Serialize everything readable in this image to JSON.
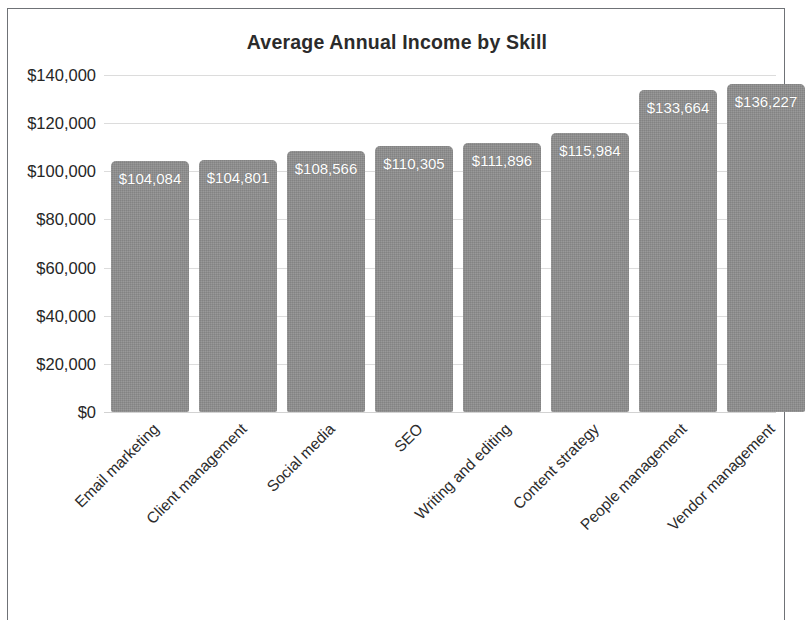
{
  "chart_data": {
    "type": "bar",
    "title": "Average Annual Income by Skill",
    "xlabel": "",
    "ylabel": "",
    "categories": [
      "Email marketing",
      "Client management",
      "Social media",
      "SEO",
      "Writing and editing",
      "Content strategy",
      "People management",
      "Vendor management"
    ],
    "values": [
      104084,
      104801,
      108566,
      110305,
      111896,
      115984,
      133664,
      136227
    ],
    "value_labels": [
      "$104,084",
      "$104,801",
      "$108,566",
      "$110,305",
      "$111,896",
      "$115,984",
      "$133,664",
      "$136,227"
    ],
    "ylim": [
      0,
      140000
    ],
    "ytick_values": [
      140000,
      120000,
      100000,
      80000,
      60000,
      40000,
      20000,
      0
    ],
    "ytick_labels": [
      "$140,000",
      "$120,000",
      "$100,000",
      "$80,000",
      "$60,000",
      "$40,000",
      "$20,000",
      "$0"
    ],
    "grid": true,
    "grid_axis": "y",
    "legend": false,
    "bar_color": "#8e8e8e",
    "value_label_color": "#ffffff",
    "axis_text_color": "#262626",
    "gridline_color": "#dcdcdc",
    "frame_color": "#6f7276",
    "background_color": "#ffffff",
    "xtick_rotation": -45
  }
}
